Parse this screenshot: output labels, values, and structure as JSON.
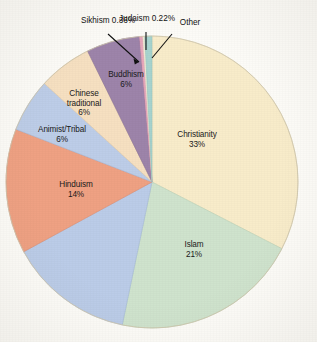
{
  "chart_data": {
    "type": "pie",
    "title": "",
    "subtitle": "",
    "xlabel": "",
    "ylabel": "",
    "legend_position": "none",
    "grid": false,
    "unit": "%",
    "start_angle_deg": 0,
    "direction": "clockwise",
    "center": {
      "x": 152,
      "y": 182
    },
    "radius": 146,
    "categories": [
      "Christianity",
      "Islam",
      "Nonreligious",
      "Hinduism",
      "Animist/Tribal",
      "Chinese traditional",
      "Buddhism",
      "Sikhism",
      "Judaism",
      "Other"
    ],
    "values": [
      33,
      21,
      14,
      14,
      6,
      6,
      6,
      0.36,
      0.22,
      0.8
    ],
    "slices": [
      {
        "name": "Christianity",
        "value": 33,
        "label": "Christianity",
        "percent_label": "33%",
        "color": "#f8ecca",
        "label_placement": "inside",
        "label_x": 197,
        "label_y": 140
      },
      {
        "name": "Islam",
        "value": 21,
        "label": "Islam",
        "percent_label": "21%",
        "color": "#cfe3cd",
        "label_placement": "inside",
        "label_x": 170,
        "label_y": 243
      },
      {
        "name": "Nonreligious",
        "value": 14,
        "label": "",
        "percent_label": "",
        "color": "#bbcce8",
        "label_placement": "none",
        "label_x": 0,
        "label_y": 0
      },
      {
        "name": "Hinduism",
        "value": 14,
        "label": "Hinduism",
        "percent_label": "14%",
        "color": "#efa183",
        "label_placement": "inside",
        "label_x": 45,
        "label_y": 182
      },
      {
        "name": "Animist/Tribal",
        "value": 6,
        "label": "Animist/Tribal",
        "percent_label": "6%",
        "color": "#bdcde8",
        "label_placement": "inside",
        "label_x": 25,
        "label_y": 127
      },
      {
        "name": "Chinese traditional",
        "value": 6,
        "label": "Chinese\ntraditional",
        "label_line1": "Chinese",
        "label_line2": "traditional",
        "percent_label": "6%",
        "color": "#f6e0c1",
        "label_placement": "inside",
        "label_x": 58,
        "label_y": 90
      },
      {
        "name": "Buddhism",
        "value": 6,
        "label": "Buddhism",
        "percent_label": "6%",
        "color": "#9d84aa",
        "label_placement": "inside",
        "label_x": 100,
        "label_y": 70
      },
      {
        "name": "Sikhism",
        "value": 0.36,
        "label": "Sikhism",
        "percent_label": "0.36%",
        "color": "#e8a8bc",
        "label_placement": "outside-leader",
        "label_x": 84,
        "label_y": 16
      },
      {
        "name": "Judaism",
        "value": 0.22,
        "label": "Judaism",
        "percent_label": "0.22%",
        "color": "#f4eed9",
        "label_placement": "outside-leader",
        "label_x": 127,
        "label_y": 13
      },
      {
        "name": "Other",
        "value": 0.8,
        "label": "Other",
        "percent_label": "",
        "color": "#a8d4cf",
        "label_placement": "outside-leader",
        "label_x": 175,
        "label_y": 20
      }
    ],
    "colors": {
      "christianity": "#f8ecca",
      "islam": "#cfe3cd",
      "nonreligious": "#bbcce8",
      "hinduism": "#efa183",
      "animist_tribal": "#bdcde8",
      "chinese_traditional": "#f6e0c1",
      "buddhism": "#9d84aa",
      "sikhism": "#e8a8bc",
      "judaism": "#f4eed9",
      "other": "#a8d4cf",
      "background": "#fdfcf8",
      "text": "#1a1a1a",
      "leader_line": "#111111"
    }
  }
}
